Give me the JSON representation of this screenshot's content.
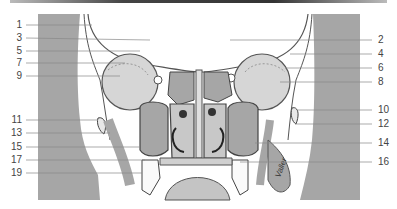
{
  "figure": {
    "type": "anatomical cross-section (coronal), nasal cavity and paranasal sinuses",
    "colors": {
      "muscle": "#a6a6a6",
      "line": "#555555",
      "bone": "#e8e8e8",
      "background": "#ffffff"
    },
    "signature": "Valler"
  },
  "labels": {
    "left": [
      {
        "text": "1",
        "y": 25
      },
      {
        "text": "3",
        "y": 38
      },
      {
        "text": "5",
        "y": 51
      },
      {
        "text": "7",
        "y": 63
      },
      {
        "text": "9",
        "y": 76
      },
      {
        "text": "11",
        "y": 120
      },
      {
        "text": "13",
        "y": 133
      },
      {
        "text": "15",
        "y": 147
      },
      {
        "text": "17",
        "y": 160
      },
      {
        "text": "19",
        "y": 173
      }
    ],
    "right": [
      {
        "text": "2",
        "y": 40
      },
      {
        "text": "4",
        "y": 54
      },
      {
        "text": "6",
        "y": 68
      },
      {
        "text": "8",
        "y": 82
      },
      {
        "text": "10",
        "y": 110
      },
      {
        "text": "12",
        "y": 124
      },
      {
        "text": "14",
        "y": 143
      },
      {
        "text": "16",
        "y": 162
      }
    ]
  }
}
